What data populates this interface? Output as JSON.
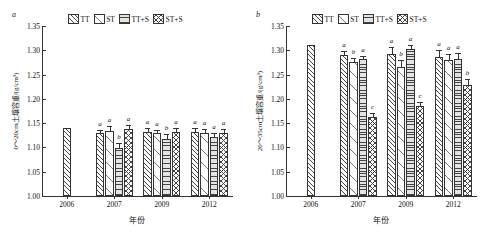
{
  "figure": {
    "panels": [
      {
        "tag": "a",
        "ytitle": "0～20cm土壤容重/(g/cm³)",
        "xtitle": "年份"
      },
      {
        "tag": "b",
        "ytitle": "20～35cm土壤容重/(g/cm³)",
        "xtitle": "年份"
      }
    ],
    "legend": [
      {
        "label": "TT",
        "pattern": "diagonal-hatch"
      },
      {
        "label": "ST",
        "pattern": "sparse-diagonal-hatch"
      },
      {
        "label": "TT+S",
        "pattern": "horizontal-lines"
      },
      {
        "label": "ST+S",
        "pattern": "cross-hatch"
      }
    ]
  },
  "chart_data": [
    {
      "type": "bar",
      "title": "a",
      "xlabel": "年份",
      "ylabel": "0～20cm土壤容重/(g/cm³)",
      "ylim": [
        1.0,
        1.35
      ],
      "yticks": [
        "1.00",
        "1.05",
        "1.10",
        "1.15",
        "1.20",
        "1.25",
        "1.30",
        "1.35"
      ],
      "grid": false,
      "legend_position": "top-center",
      "categories": [
        "2006",
        "2007",
        "2009",
        "2012"
      ],
      "series": [
        {
          "name": "TT",
          "values": [
            1.14,
            1.13,
            1.132,
            1.132
          ],
          "errors": [
            0.0,
            0.006,
            0.007,
            0.008
          ],
          "letters": [
            "",
            "a",
            "a",
            "a"
          ]
        },
        {
          "name": "ST",
          "values": [
            null,
            1.133,
            1.13,
            1.13
          ],
          "errors": [
            null,
            0.011,
            0.006,
            0.007
          ],
          "letters": [
            "",
            "a",
            "a",
            "a"
          ]
        },
        {
          "name": "TT+S",
          "values": [
            null,
            1.098,
            1.118,
            1.121
          ],
          "errors": [
            null,
            0.012,
            0.01,
            0.009
          ],
          "letters": [
            "",
            "b",
            "b",
            "a"
          ]
        },
        {
          "name": "ST+S",
          "values": [
            null,
            1.138,
            1.132,
            1.13
          ],
          "errors": [
            null,
            0.009,
            0.008,
            0.008
          ],
          "letters": [
            "",
            "a",
            "a",
            "a"
          ]
        }
      ]
    },
    {
      "type": "bar",
      "title": "b",
      "xlabel": "年份",
      "ylabel": "20～35cm土壤容重/(g/cm³)",
      "ylim": [
        1.0,
        1.35
      ],
      "yticks": [
        "1.00",
        "1.05",
        "1.10",
        "1.15",
        "1.20",
        "1.25",
        "1.30",
        "1.35"
      ],
      "grid": false,
      "legend_position": "top-center",
      "categories": [
        "2006",
        "2007",
        "2009",
        "2012"
      ],
      "series": [
        {
          "name": "TT",
          "values": [
            1.31,
            1.29,
            1.293,
            1.286
          ],
          "errors": [
            0.0,
            0.009,
            0.013,
            0.014
          ],
          "letters": [
            "",
            "a",
            "a",
            "a"
          ]
        },
        {
          "name": "ST",
          "values": [
            null,
            1.275,
            1.265,
            1.281
          ],
          "errors": [
            null,
            0.009,
            0.014,
            0.012
          ],
          "letters": [
            "",
            "b",
            "b",
            "a"
          ]
        },
        {
          "name": "TT+S",
          "values": [
            null,
            1.282,
            1.302,
            1.283
          ],
          "errors": [
            null,
            0.007,
            0.008,
            0.012
          ],
          "letters": [
            "",
            "a",
            "a",
            "a"
          ]
        },
        {
          "name": "ST+S",
          "values": [
            null,
            1.162,
            1.185,
            1.228
          ],
          "errors": [
            null,
            0.009,
            0.008,
            0.013
          ],
          "letters": [
            "",
            "c",
            "c",
            "b"
          ]
        }
      ]
    }
  ]
}
